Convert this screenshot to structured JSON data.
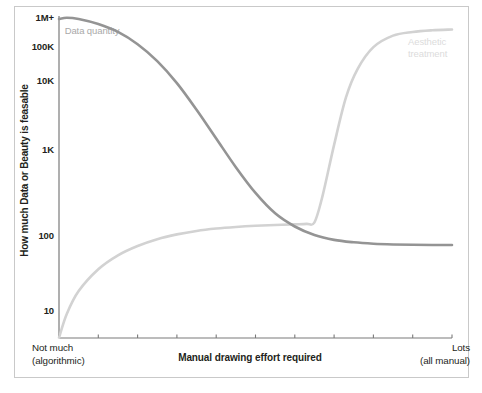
{
  "chart_data": {
    "type": "line",
    "title": "",
    "xlabel": "Manual drawing effort required",
    "ylabel": "How much Data or Beauty is feasable",
    "yscale": "log",
    "ytick_labels": [
      "1M+",
      "100K",
      "10K",
      "1K",
      "100",
      "10"
    ],
    "ytick_values": [
      1000000,
      100000,
      10000,
      1000,
      100,
      10
    ],
    "ylim": [
      3,
      1000000
    ],
    "xlim": [
      0,
      100
    ],
    "x_axis_left_label": "Not much",
    "x_axis_left_sublabel": "(algorithmic)",
    "x_axis_right_label": "Lots",
    "x_axis_right_sublabel": "(all manual)",
    "x_tick_count": 11,
    "grid": false,
    "legend_position": "inline-annotations",
    "series": [
      {
        "name": "Data quantity",
        "color": "#949494",
        "label_color": "#a9a9a9",
        "x": [
          0,
          2,
          5,
          10,
          15,
          20,
          25,
          30,
          35,
          40,
          45,
          50,
          55,
          60,
          65,
          70,
          75,
          80,
          85,
          90,
          95,
          100
        ],
        "y": [
          1000000,
          1050000,
          1000000,
          820000,
          600000,
          370000,
          190000,
          80000,
          28000,
          9000,
          2900,
          1050,
          470,
          280,
          200,
          165,
          150,
          142,
          138,
          136,
          135,
          135
        ]
      },
      {
        "name": "Aesthetic treatment",
        "color": "#d2d2d2",
        "label_color": "#dcdcdc",
        "x": [
          0,
          2,
          5,
          10,
          15,
          20,
          25,
          30,
          35,
          40,
          45,
          50,
          55,
          60,
          63,
          65,
          67,
          70,
          73,
          76,
          80,
          85,
          90,
          95,
          100
        ],
        "y": [
          3.5,
          9,
          22,
          52,
          90,
          130,
          170,
          205,
          235,
          258,
          275,
          288,
          297,
          304,
          310,
          330,
          900,
          7000,
          45000,
          140000,
          330000,
          520000,
          600000,
          640000,
          660000
        ]
      }
    ],
    "annotations": [
      {
        "text": "Data quantity",
        "series": "Data quantity"
      },
      {
        "text": "Aesthetic treatment",
        "series": "Aesthetic treatment"
      }
    ]
  },
  "figure": {
    "frame_color": "#c9c9c9",
    "axis_color": "#6f6f6f",
    "background": "#ffffff",
    "text_color": "#231f20"
  }
}
